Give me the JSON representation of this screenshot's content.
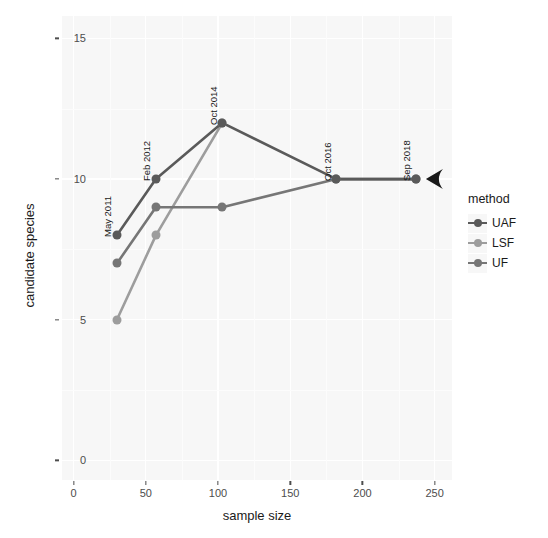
{
  "chart_data": {
    "type": "line",
    "title": "",
    "xlabel": "sample size",
    "ylabel": "candidate species",
    "xlim": [
      -8,
      262
    ],
    "ylim": [
      -0.7,
      15.8
    ],
    "xticks": [
      0,
      50,
      100,
      150,
      200,
      250
    ],
    "yticks": [
      0,
      5,
      10,
      15
    ],
    "grid": true,
    "legend_position": "right",
    "legend_title": "method",
    "series": [
      {
        "name": "UAF",
        "color": "#5a5a5a",
        "x": [
          30,
          57,
          103,
          182,
          237
        ],
        "y": [
          8,
          10,
          12,
          10,
          10
        ]
      },
      {
        "name": "LSF",
        "color": "#9d9d9d",
        "x": [
          30,
          57,
          103
        ],
        "y": [
          5,
          8,
          12
        ]
      },
      {
        "name": "UF",
        "color": "#767676",
        "x": [
          30,
          57,
          103,
          182,
          237
        ],
        "y": [
          7,
          9,
          9,
          10,
          10
        ]
      }
    ],
    "annotations": [
      {
        "label": "May 2011",
        "x": 30,
        "y": 8
      },
      {
        "label": "Feb 2012",
        "x": 57,
        "y": 10
      },
      {
        "label": "Oct 2014",
        "x": 103,
        "y": 12
      },
      {
        "label": "Oct 2016",
        "x": 182,
        "y": 10
      },
      {
        "label": "Sep 2018",
        "x": 237,
        "y": 10
      }
    ],
    "arrow_marker": {
      "x": 237,
      "y": 10,
      "direction": "left",
      "color": "#1a1a1a"
    }
  },
  "axes": {
    "x_tick_labels": [
      "0",
      "50",
      "100",
      "150",
      "200",
      "250"
    ],
    "y_tick_labels": [
      "0",
      "5",
      "10",
      "15"
    ],
    "x_title": "sample size",
    "y_title": "candidate species"
  },
  "legend": {
    "title": "method",
    "items": [
      {
        "label": "UAF",
        "color": "#5a5a5a"
      },
      {
        "label": "LSF",
        "color": "#9d9d9d"
      },
      {
        "label": "UF",
        "color": "#767676"
      }
    ]
  },
  "theme": {
    "panel_background": "#f7f7f7",
    "grid_color": "#ffffff",
    "plot_background": "#ffffff",
    "text_color": "#1a1a1a"
  }
}
